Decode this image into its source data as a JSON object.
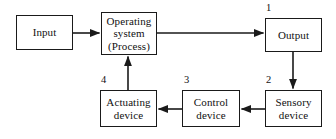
{
  "diagram": {
    "type": "flowchart",
    "stroke_color": "#1a1a1a",
    "text_color": "#111111",
    "background_color": "#ffffff",
    "nodes": [
      {
        "id": "input",
        "label_line1": "Input",
        "label_line2": "",
        "label_line3": "",
        "number": ""
      },
      {
        "id": "operating",
        "label_line1": "Operating",
        "label_line2": "system",
        "label_line3": "(Process)",
        "number": ""
      },
      {
        "id": "output",
        "label_line1": "Output",
        "label_line2": "",
        "label_line3": "",
        "number": "1"
      },
      {
        "id": "sensory",
        "label_line1": "Sensory",
        "label_line2": "device",
        "label_line3": "",
        "number": "2"
      },
      {
        "id": "control",
        "label_line1": "Control",
        "label_line2": "device",
        "label_line3": "",
        "number": "3"
      },
      {
        "id": "actuating",
        "label_line1": "Actuating",
        "label_line2": "device",
        "label_line3": "",
        "number": "4"
      }
    ],
    "numbers": {
      "one": "1",
      "two": "2",
      "three": "3",
      "four": "4"
    },
    "edges": [
      {
        "from": "input",
        "to": "operating",
        "direction": "right"
      },
      {
        "from": "operating",
        "to": "output",
        "direction": "right"
      },
      {
        "from": "output",
        "to": "sensory",
        "direction": "down"
      },
      {
        "from": "sensory",
        "to": "control",
        "direction": "left"
      },
      {
        "from": "control",
        "to": "actuating",
        "direction": "left"
      },
      {
        "from": "actuating",
        "to": "operating",
        "direction": "up"
      }
    ]
  }
}
